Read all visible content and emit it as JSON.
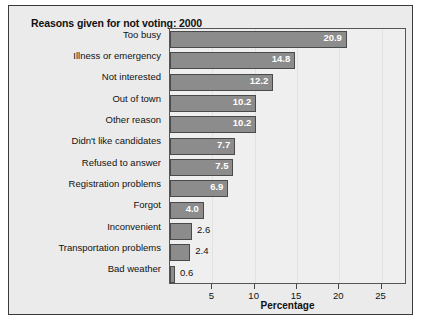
{
  "chart_data": {
    "type": "bar",
    "orientation": "horizontal",
    "title": "Reasons given for not voting: 2000",
    "xlabel": "Percentage",
    "ylabel": "",
    "categories": [
      "Too busy",
      "Illness or emergency",
      "Not interested",
      "Out of town",
      "Other reason",
      "Didn't like candidates",
      "Refused to answer",
      "Registration problems",
      "Forgot",
      "Inconvenient",
      "Transportation problems",
      "Bad weather"
    ],
    "values": [
      20.9,
      14.8,
      12.2,
      10.2,
      10.2,
      7.7,
      7.5,
      6.9,
      4.0,
      2.6,
      2.4,
      0.6
    ],
    "value_labels": [
      "20.9",
      "14.8",
      "12.2",
      "10.2",
      "10.2",
      "7.7",
      "7.5",
      "6.9",
      "4.0",
      "2.6",
      "2.4",
      "0.6"
    ],
    "label_placement": [
      "inside",
      "inside",
      "inside",
      "inside",
      "inside",
      "inside",
      "inside",
      "inside",
      "inside",
      "outside",
      "outside",
      "outside"
    ],
    "xlim": [
      0,
      28
    ],
    "xticks": [
      5,
      10,
      15,
      20,
      25
    ],
    "xtick_labels": [
      "5",
      "10",
      "15",
      "20",
      "25"
    ],
    "grid": false,
    "legend": "none",
    "bar_color": "#8c8c8c",
    "bar_edge_color": "#4a4a4a",
    "plot_background": "#efefef",
    "figure_background": "#ebebeb"
  }
}
